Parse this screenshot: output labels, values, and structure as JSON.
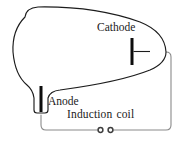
{
  "diagram": {
    "type": "schematic",
    "labels": {
      "cathode": "Cathode",
      "anode": "Anode",
      "induction_coil_word1": "Induction",
      "induction_coil_word2": "coil",
      "induction_coil_full": "Induction coil"
    },
    "components": {
      "bulb": {
        "name": "vacuum-tube-bulb",
        "outline_color": "#1c1c1c",
        "fill_color": "#ffffff",
        "stroke_width": 1.1
      },
      "cathode_electrode": {
        "name": "cathode-electrode",
        "color": "#0d0d0d",
        "orientation": "vertical-bar",
        "width": 3,
        "height": 27
      },
      "anode_electrode": {
        "name": "anode-electrode",
        "color": "#0d0d0d",
        "orientation": "vertical-bar",
        "width": 3,
        "height": 26
      },
      "circuit_wire": {
        "name": "circuit-wire",
        "color": "#8a8a8a",
        "stroke_width": 1.1
      },
      "coil_terminal_left": {
        "name": "coil-terminal-left",
        "shape": "small-open-circle",
        "radius": 2.3,
        "color": "#4a4a4a"
      },
      "coil_terminal_right": {
        "name": "coil-terminal-right",
        "shape": "small-open-circle",
        "radius": 2.3,
        "color": "#4a4a4a"
      }
    },
    "colors": {
      "background": "#ffffff",
      "ink": "#1c1c1c",
      "wire": "#8a8a8a",
      "text": "#1a1a1a"
    }
  }
}
